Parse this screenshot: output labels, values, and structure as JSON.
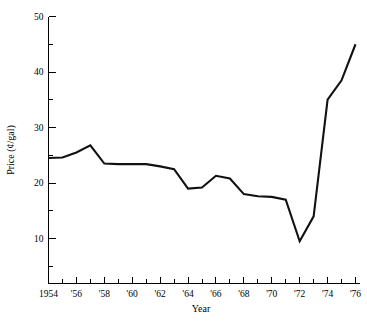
{
  "chart_data": {
    "type": "line",
    "title": "",
    "xlabel": "Year",
    "ylabel": "Price (¢/gal)",
    "xlim": [
      1954,
      1976
    ],
    "ylim": [
      5,
      50
    ],
    "grid": false,
    "legend": null,
    "y_ticks_major": [
      10,
      20,
      30,
      40,
      50
    ],
    "y_ticks_minor": [
      5,
      15,
      25,
      35,
      45
    ],
    "y_tick_labels": [
      "10",
      "20",
      "30",
      "40",
      "50"
    ],
    "x_ticks_major": [
      1954,
      1956,
      1958,
      1960,
      1962,
      1964,
      1966,
      1968,
      1970,
      1972,
      1974,
      1976
    ],
    "x_tick_labels": [
      "1954",
      "'56",
      "'58",
      "'60",
      "'62",
      "'64",
      "'66",
      "'68",
      "'70",
      "'72",
      "'74",
      "'76"
    ],
    "x_ticks_minor": [
      1955,
      1957,
      1959,
      1961,
      1963,
      1965,
      1967,
      1969,
      1971,
      1973,
      1975
    ],
    "x": [
      1954,
      1955,
      1956,
      1957,
      1958,
      1959,
      1960,
      1961,
      1962,
      1963,
      1964,
      1965,
      1966,
      1967,
      1968,
      1969,
      1970,
      1971,
      1972,
      1973,
      1974,
      1975,
      1976
    ],
    "values": [
      24.5,
      24.6,
      25.5,
      26.8,
      23.5,
      23.4,
      23.4,
      23.4,
      23.0,
      22.5,
      19.0,
      19.2,
      21.3,
      20.8,
      18.0,
      17.6,
      17.5,
      17.0,
      9.5,
      14.0,
      35.0,
      38.5,
      45.0
    ],
    "series": [
      {
        "name": "Price",
        "color": "#111111",
        "values": [
          24.5,
          24.6,
          25.5,
          26.8,
          23.5,
          23.4,
          23.4,
          23.4,
          23.0,
          22.5,
          19.0,
          19.2,
          21.3,
          20.8,
          18.0,
          17.6,
          17.5,
          17.0,
          9.5,
          14.0,
          35.0,
          38.5,
          45.0
        ]
      }
    ]
  },
  "axes": {
    "y_title": "Price (¢/gal)",
    "x_title": "Year"
  },
  "colors": {
    "line": "#111111",
    "axis": "#000000",
    "background": "#ffffff"
  }
}
